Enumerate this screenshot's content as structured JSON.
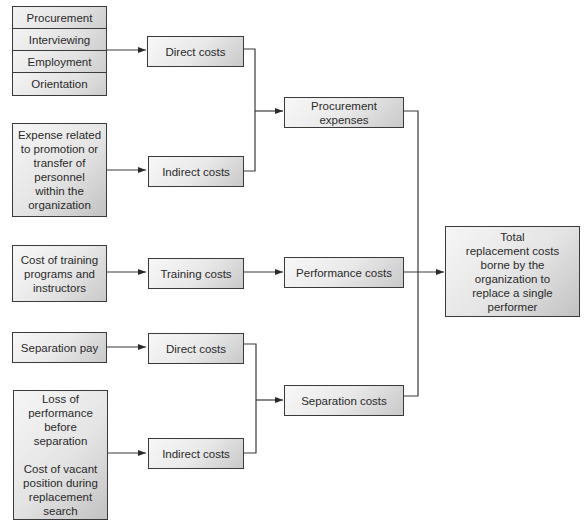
{
  "diagram": {
    "procurement_sources": [
      "Procurement",
      "Interviewing",
      "Employment",
      "Orientation"
    ],
    "expense_related": "Expense related\nto promotion or\ntransfer of\npersonnel\nwithin the\norganization",
    "training_source": "Cost of training\nprograms and\ninstructors",
    "separation_pay": "Separation pay",
    "loss_source": "Loss of\nperformance\nbefore\nseparation\n\nCost of vacant\nposition during\nreplacement\nsearch",
    "direct_costs_1": "Direct costs",
    "indirect_costs_1": "Indirect costs",
    "training_costs": "Training costs",
    "direct_costs_2": "Direct costs",
    "indirect_costs_2": "Indirect costs",
    "procurement_expenses": "Procurement expenses",
    "performance_costs": "Performance costs",
    "separation_costs": "Separation costs",
    "total": "Total\nreplacement costs\nborne by the\norganization to\nreplace a single\nperformer"
  }
}
